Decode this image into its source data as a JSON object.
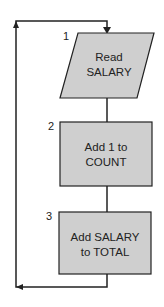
{
  "diagram": {
    "type": "flowchart",
    "colors": {
      "fill": "#cfcfcf",
      "stroke": "#222222",
      "background": "#ffffff"
    },
    "steps": [
      {
        "number": "1",
        "shape": "parallelogram",
        "line1": "Read",
        "line2": "SALARY"
      },
      {
        "number": "2",
        "shape": "rectangle",
        "line1": "Add 1 to",
        "line2": "COUNT"
      },
      {
        "number": "3",
        "shape": "rectangle",
        "line1": "Add SALARY",
        "line2": "to TOTAL"
      }
    ],
    "loop": {
      "description": "arrow from step 3 back to step 1"
    }
  }
}
